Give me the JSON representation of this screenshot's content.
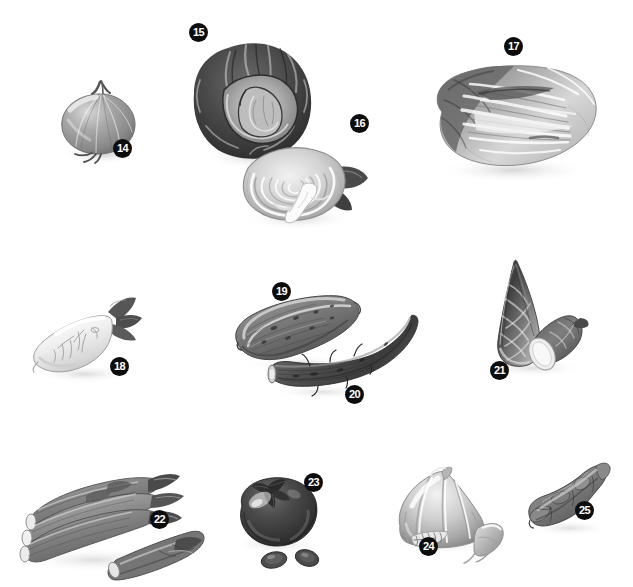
{
  "plate": {
    "title": "Vegetables Illustration Plate",
    "background_color": "#ffffff",
    "width": 633,
    "height": 587,
    "badge_color": "#0d0d0d",
    "badge_text_color": "#ffffff",
    "style": "grayscale airbrush illustration"
  },
  "figures": [
    {
      "number": "14",
      "name": "onion",
      "label": "Onion",
      "badge_x": 122,
      "badge_y": 148,
      "tone": "#8e8e8e"
    },
    {
      "number": "15",
      "name": "red-cabbage",
      "label": "Red cabbage",
      "badge_x": 198,
      "badge_y": 32,
      "tone": "#4a4a4a"
    },
    {
      "number": "16",
      "name": "cabbage-cross-section",
      "label": "Cabbage, cross section",
      "badge_x": 359,
      "badge_y": 123,
      "tone": "#c9c9c9"
    },
    {
      "number": "17",
      "name": "napa-cabbage",
      "label": "Napa cabbage",
      "badge_x": 513,
      "badge_y": 46,
      "tone": "#a3a3a3"
    },
    {
      "number": "18",
      "name": "daikon-radish",
      "label": "Daikon radish",
      "badge_x": 119,
      "badge_y": 366,
      "tone": "#e3e3e3"
    },
    {
      "number": "19",
      "name": "cucumber",
      "label": "Cucumber",
      "badge_x": 281,
      "badge_y": 291,
      "tone": "#7b7b7b"
    },
    {
      "number": "20",
      "name": "burdock-root",
      "label": "Burdock root",
      "badge_x": 354,
      "badge_y": 394,
      "tone": "#545454"
    },
    {
      "number": "21",
      "name": "bamboo-shoot",
      "label": "Bamboo shoot",
      "badge_x": 499,
      "badge_y": 370,
      "tone": "#6e6e6e"
    },
    {
      "number": "22",
      "name": "asparagus-bundle",
      "label": "Asparagus",
      "badge_x": 159,
      "badge_y": 519,
      "tone": "#909090"
    },
    {
      "number": "23",
      "name": "eggplant",
      "label": "Eggplant",
      "badge_x": 313,
      "badge_y": 482,
      "tone": "#3c3c3c"
    },
    {
      "number": "24",
      "name": "garlic",
      "label": "Garlic",
      "badge_x": 428,
      "badge_y": 546,
      "tone": "#b5b5b5"
    },
    {
      "number": "25",
      "name": "ginger-root",
      "label": "Ginger root",
      "badge_x": 584,
      "badge_y": 510,
      "tone": "#8a8a8a"
    }
  ]
}
